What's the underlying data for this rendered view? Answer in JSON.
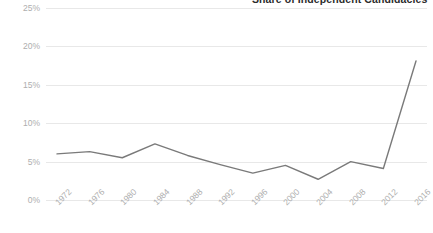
{
  "chart_data": {
    "type": "line",
    "title": "Share of Independent Candidacies",
    "xlabel": "",
    "ylabel": "",
    "categories": [
      "1972",
      "1976",
      "1980",
      "1984",
      "1988",
      "1992",
      "1996",
      "2000",
      "2004",
      "2008",
      "2012",
      "2016"
    ],
    "series": [
      {
        "name": "Share of Independent Candidacies",
        "values": [
          6.0,
          6.3,
          5.5,
          7.3,
          5.8,
          4.6,
          3.5,
          4.5,
          2.7,
          5.0,
          4.1,
          18.1
        ]
      }
    ],
    "ylim": [
      0,
      25
    ],
    "yticks": [
      0,
      5,
      10,
      15,
      20,
      25
    ],
    "ytick_labels": [
      "0%",
      "5%",
      "10%",
      "15%",
      "20%",
      "25%"
    ],
    "grid": true,
    "legend": false,
    "line_color": "#7a7a7a",
    "grid_color": "#e8e8e8",
    "tick_label_color": "#aeaeae",
    "title_color": "#2b2b2b",
    "background_color": "#ffffff",
    "xtick_rotation": -45
  }
}
